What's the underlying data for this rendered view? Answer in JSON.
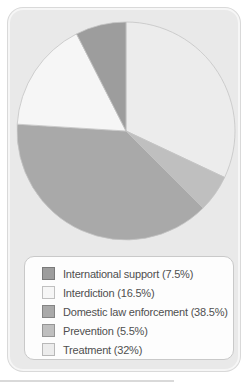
{
  "chart_data": {
    "type": "pie",
    "title": "",
    "legend_position": "bottom",
    "start": "top",
    "draw_direction": "clockwise-from-top-in-reverse-legend-order",
    "clockwise_from_top_order": [
      "Treatment",
      "Prevention",
      "Domestic law enforcement",
      "Interdiction",
      "International support"
    ],
    "stroke_color": "#c4c4c4",
    "slices": [
      {
        "id": "international-support",
        "name": "International support",
        "value": 7.5,
        "label": "International support (7.5%)",
        "color": "#9d9d9d"
      },
      {
        "id": "interdiction",
        "name": "Interdiction",
        "value": 16.5,
        "label": "Interdiction (16.5%)",
        "color": "#f6f6f6"
      },
      {
        "id": "domestic-law-enforcement",
        "name": "Domestic law enforcement",
        "value": 38.5,
        "label": "Domestic law enforcement (38.5%)",
        "color": "#a9a9a9"
      },
      {
        "id": "prevention",
        "name": "Prevention",
        "value": 5.5,
        "label": "Prevention (5.5%)",
        "color": "#bfbfbf"
      },
      {
        "id": "treatment",
        "name": "Treatment",
        "value": 32,
        "label": "Treatment (32%)",
        "color": "#ececec"
      }
    ]
  },
  "colors": {
    "card_background": "#e9e9e9",
    "legend_background": "#fdfdfd",
    "legend_border": "#c9c9c9",
    "text": "#4f4f4f"
  }
}
